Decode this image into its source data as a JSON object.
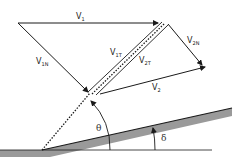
{
  "diagram": {
    "labels": {
      "v1": {
        "main": "V",
        "sub": "1"
      },
      "v1n": {
        "main": "V",
        "sub": "1N"
      },
      "v1t": {
        "main": "V",
        "sub": "1T"
      },
      "v2t": {
        "main": "V",
        "sub": "2T"
      },
      "v2n": {
        "main": "V",
        "sub": "2N"
      },
      "v2": {
        "main": "V",
        "sub": "2"
      },
      "theta": "θ",
      "delta": "δ"
    },
    "colors": {
      "line": "#1a1a1a",
      "wedge_fill": "#9a9a9a",
      "background": "#ffffff"
    }
  }
}
